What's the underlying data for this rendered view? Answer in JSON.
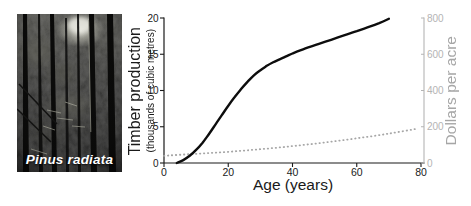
{
  "photo": {
    "caption": "Pinus radiata"
  },
  "labels": {
    "x": "Age (years)",
    "left_title": "Timber production",
    "left_sub": "(thousands of cubic metres)",
    "right": "Dollars per acre"
  },
  "colors": {
    "axis_dark": "#1a1a1a",
    "axis_light": "#b4b4b4",
    "tick_text_dark": "#1a1a1a",
    "tick_text_light": "#b4b4b4",
    "timber_curve": "#0d0d0d",
    "dollars_curve": "#a6a6a6",
    "background": "#ffffff"
  },
  "chart_data": {
    "type": "line",
    "title": "",
    "xlabel": "Age (years)",
    "x_range": [
      0,
      80
    ],
    "x_ticks": [
      0,
      20,
      40,
      60,
      80
    ],
    "left_axis": {
      "label": "Timber production (thousands of cubic metres)",
      "range": [
        0,
        20
      ],
      "ticks": [
        0,
        5,
        10,
        15,
        20
      ]
    },
    "right_axis": {
      "label": "Dollars per acre",
      "range": [
        0,
        800
      ],
      "ticks": [
        0,
        200,
        400,
        600,
        800
      ]
    },
    "grid": false,
    "legend": "none",
    "series": [
      {
        "name": "Timber production",
        "axis": "left",
        "style": "solid",
        "color": "#0d0d0d",
        "width": 2.4,
        "points": [
          [
            4,
            0
          ],
          [
            6,
            0.4
          ],
          [
            8,
            1.0
          ],
          [
            10,
            1.8
          ],
          [
            12,
            2.8
          ],
          [
            14,
            4.0
          ],
          [
            16,
            5.3
          ],
          [
            18,
            6.6
          ],
          [
            20,
            7.9
          ],
          [
            22,
            9.1
          ],
          [
            24,
            10.2
          ],
          [
            26,
            11.2
          ],
          [
            28,
            12.1
          ],
          [
            30,
            12.8
          ],
          [
            32,
            13.4
          ],
          [
            34,
            13.9
          ],
          [
            36,
            14.3
          ],
          [
            38,
            14.7
          ],
          [
            40,
            15.1
          ],
          [
            44,
            15.8
          ],
          [
            48,
            16.4
          ],
          [
            52,
            17.0
          ],
          [
            56,
            17.6
          ],
          [
            60,
            18.2
          ],
          [
            64,
            18.8
          ],
          [
            67,
            19.3
          ],
          [
            70,
            19.9
          ]
        ]
      },
      {
        "name": "Dollars per acre",
        "axis": "right",
        "style": "dotted",
        "color": "#a6a6a6",
        "width": 1.8,
        "points": [
          [
            0,
            40
          ],
          [
            10,
            51
          ],
          [
            20,
            62
          ],
          [
            30,
            76
          ],
          [
            40,
            93
          ],
          [
            50,
            113
          ],
          [
            60,
            136
          ],
          [
            70,
            162
          ],
          [
            79,
            190
          ]
        ]
      }
    ]
  }
}
